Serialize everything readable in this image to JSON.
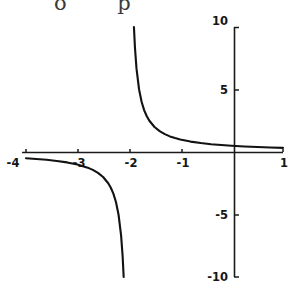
{
  "figure": {
    "top_fragment_text": "o p",
    "background_color": "#ffffff",
    "curve_color": "#121212",
    "axis_color": "#1a1a1a"
  },
  "chart_data": {
    "type": "line",
    "title": "",
    "subtitle": "",
    "xlabel": "",
    "ylabel": "",
    "function": "y = 1/(x+2)",
    "xlim": [
      -4,
      1
    ],
    "ylim": [
      -10,
      10
    ],
    "grid": false,
    "legend": null,
    "x_ticks": [
      -4,
      -3,
      -2,
      -1,
      1
    ],
    "x_tick_labels": [
      "-4",
      "-3",
      "-2",
      "-1",
      "1"
    ],
    "y_ticks": [
      -10,
      -5,
      5,
      10
    ],
    "y_tick_labels": [
      "-10",
      "-5",
      "5",
      "10"
    ],
    "asymptotes": {
      "vertical": [
        -2
      ],
      "horizontal": [
        0
      ]
    },
    "series": [
      {
        "name": "left-branch",
        "x": [
          -4,
          -3.8,
          -3.6,
          -3.4,
          -3.2,
          -3,
          -2.8,
          -2.7,
          -2.6,
          -2.5,
          -2.4,
          -2.35,
          -2.3,
          -2.25,
          -2.2,
          -2.15,
          -2.12,
          -2.1
        ],
        "values": [
          -0.5,
          -0.556,
          -0.625,
          -0.714,
          -0.833,
          -1,
          -1.25,
          -1.429,
          -1.667,
          -2,
          -2.5,
          -2.857,
          -3.333,
          -4,
          -5,
          -6.667,
          -8.333,
          -10
        ]
      },
      {
        "name": "right-branch",
        "x": [
          -1.9,
          -1.88,
          -1.85,
          -1.8,
          -1.75,
          -1.7,
          -1.65,
          -1.6,
          -1.5,
          -1.4,
          -1.3,
          -1.2,
          -1.1,
          -1,
          -0.8,
          -0.6,
          -0.4,
          -0.2,
          0,
          0.25,
          0.5,
          0.75,
          1
        ],
        "values": [
          10,
          8.333,
          6.667,
          5,
          4,
          3.333,
          2.857,
          2.5,
          2,
          1.667,
          1.429,
          1.25,
          1.111,
          1,
          0.833,
          0.714,
          0.625,
          0.556,
          0.5,
          0.444,
          0.4,
          0.364,
          0.333
        ]
      }
    ]
  }
}
